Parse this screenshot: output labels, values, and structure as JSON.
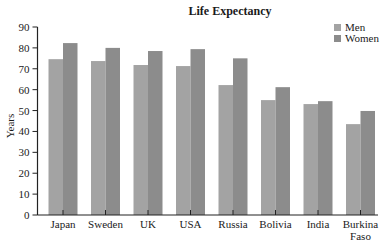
{
  "chart_data": {
    "type": "bar",
    "title": "Life Expectancy",
    "xlabel": "",
    "ylabel": "Years",
    "ylim": [
      0,
      90
    ],
    "yticks": [
      0,
      10,
      20,
      30,
      40,
      50,
      60,
      70,
      80,
      90
    ],
    "grid": false,
    "legend_position": "top-right",
    "categories": [
      "Japan",
      "Sweden",
      "UK",
      "USA",
      "Russia",
      "Bolivia",
      "India",
      "Burkina Faso"
    ],
    "category_lines": [
      [
        "Japan"
      ],
      [
        "Sweden"
      ],
      [
        "UK"
      ],
      [
        "USA"
      ],
      [
        "Russia"
      ],
      [
        "Bolivia"
      ],
      [
        "India"
      ],
      [
        "Burkina",
        "Faso"
      ]
    ],
    "series": [
      {
        "name": "Men",
        "color": "#a3a3a3",
        "values": [
          74.6,
          73.7,
          71.8,
          71.3,
          62.2,
          55.0,
          53.1,
          43.5
        ]
      },
      {
        "name": "Women",
        "color": "#8c8c8c",
        "values": [
          82.3,
          80.0,
          78.5,
          79.4,
          75.0,
          61.2,
          54.5,
          49.8
        ]
      }
    ]
  },
  "legend": {
    "items": [
      {
        "label": "Men",
        "color": "#a3a3a3"
      },
      {
        "label": "Women",
        "color": "#8c8c8c"
      }
    ]
  }
}
